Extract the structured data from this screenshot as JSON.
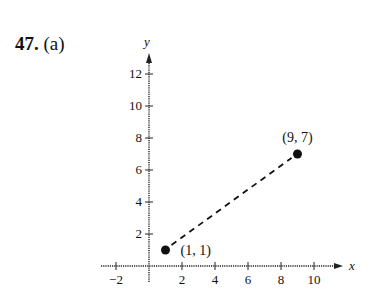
{
  "problem": {
    "number": "47.",
    "part": "(a)"
  },
  "chart_data": {
    "type": "scatter",
    "title": "",
    "xlabel": "x",
    "ylabel": "y",
    "xlim": [
      -3,
      12
    ],
    "ylim": [
      0,
      13
    ],
    "x_ticks": [
      -2,
      2,
      4,
      6,
      8,
      10
    ],
    "y_ticks": [
      2,
      4,
      6,
      8,
      10,
      12
    ],
    "grid": false,
    "points": [
      {
        "x": 1,
        "y": 1,
        "label": "(1, 1)"
      },
      {
        "x": 9,
        "y": 7,
        "label": "(9, 7)"
      }
    ],
    "segments": [
      {
        "from": [
          1,
          1
        ],
        "to": [
          9,
          7
        ],
        "style": "dashed"
      }
    ]
  }
}
